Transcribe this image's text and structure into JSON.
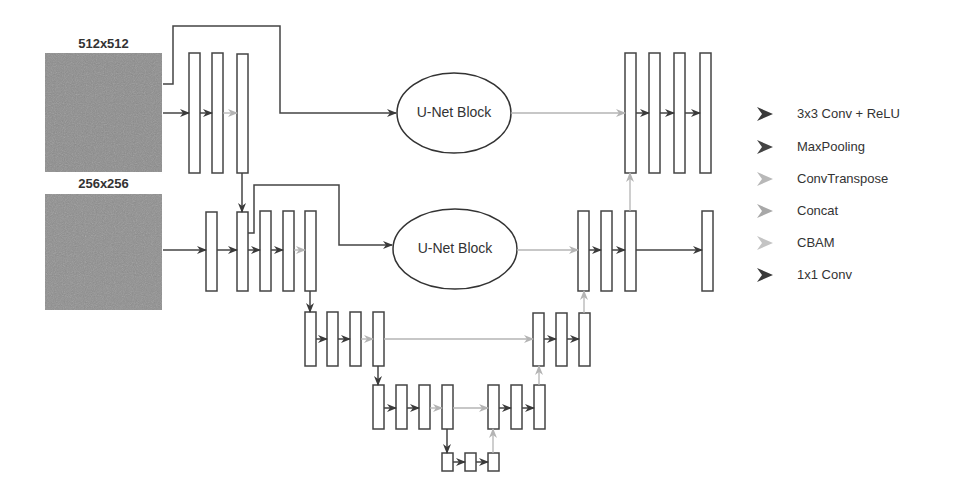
{
  "inputs": [
    {
      "label": "512x512"
    },
    {
      "label": "256x256"
    }
  ],
  "blocks": [
    {
      "label": "U-Net Block"
    },
    {
      "label": "U-Net Block"
    }
  ],
  "legend": [
    {
      "label": "3x3 Conv + ReLU",
      "icon": "arrow-dark-icon",
      "color": "#3a3a3a"
    },
    {
      "label": "MaxPooling",
      "icon": "arrow-dark-icon",
      "color": "#444444"
    },
    {
      "label": "ConvTranspose",
      "icon": "arrow-light-icon",
      "color": "#b8b8b8"
    },
    {
      "label": "Concat",
      "icon": "arrow-light-icon",
      "color": "#a8a8a8"
    },
    {
      "label": "CBAM",
      "icon": "arrow-light-icon",
      "color": "#c4c4c4"
    },
    {
      "label": "1x1 Conv",
      "icon": "arrow-dark-icon",
      "color": "#3a3a3a"
    }
  ],
  "colors": {
    "dark": "#444444",
    "light": "#b0b0b0",
    "image_fill": "#8c8c8c"
  }
}
